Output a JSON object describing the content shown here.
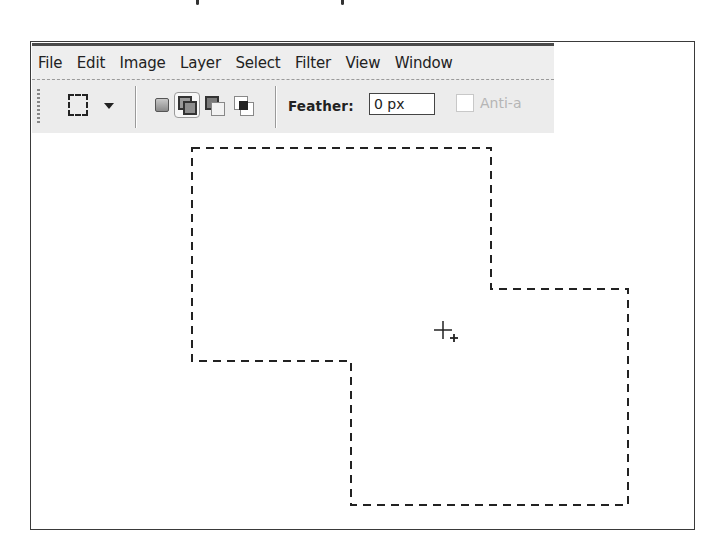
{
  "menubar": {
    "items": [
      {
        "label": "File"
      },
      {
        "label": "Edit"
      },
      {
        "label": "Image"
      },
      {
        "label": "Layer"
      },
      {
        "label": "Select"
      },
      {
        "label": "Filter"
      },
      {
        "label": "View"
      },
      {
        "label": "Window"
      }
    ]
  },
  "toolbar": {
    "tool_icon": "rectangular-marquee-icon",
    "selection_modes": [
      {
        "name": "new-selection",
        "selected": false
      },
      {
        "name": "add-to-selection",
        "selected": true
      },
      {
        "name": "subtract-from-selection",
        "selected": false
      },
      {
        "name": "intersect-with-selection",
        "selected": false
      }
    ],
    "feather_label": "Feather:",
    "feather_value": "0 px",
    "anti_alias_label": "Anti-a",
    "anti_alias_checked": false
  },
  "canvas": {
    "selection_points": "192,148 491,148 491,289 628,289 628,505 351,505 351,361 192,361",
    "cursor": {
      "icon": "crosshair-add-icon",
      "x": 443,
      "y": 330
    }
  },
  "colors": {
    "menubar_bg": "#eeeeee",
    "toolbar_bg": "#ececec",
    "frame_border": "#3a3a3a",
    "marching_ants": "#222222"
  }
}
